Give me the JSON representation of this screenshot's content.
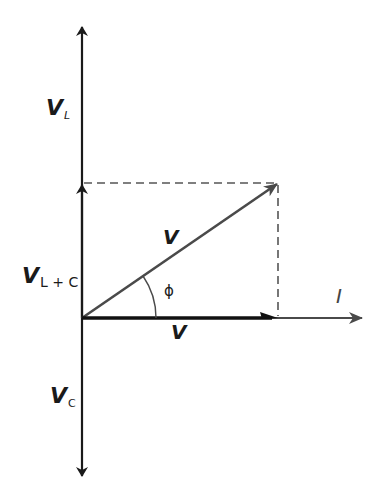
{
  "diagram": {
    "type": "phasor-diagram",
    "colors": {
      "axis": "#1a1a1a",
      "resultant": "#4a4a4a",
      "dashed": "#555555",
      "background": "#ffffff"
    },
    "labels": {
      "v_l": {
        "main": "V",
        "sub": "L"
      },
      "v_lc": {
        "main": "V",
        "sub": "L + C"
      },
      "v_c": {
        "main": "V",
        "sub": "C"
      },
      "v_resultant": "V",
      "v_resistive": "V",
      "current": "I",
      "phase_angle": "ϕ"
    }
  }
}
